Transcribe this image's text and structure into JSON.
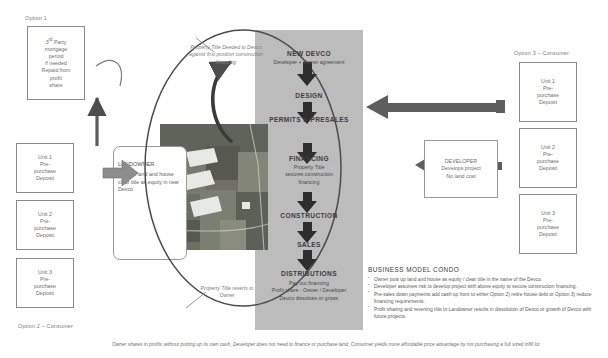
{
  "left_column": {
    "option_label_top": "Option 1",
    "option_label_bottom": "Option 2 – Consumer",
    "boxes": [
      {
        "name": "third-party-mortgage",
        "lines": [
          "3ʳᵈ Party",
          "mortgage",
          "period",
          "if needed",
          "Repaid from",
          "profit",
          "share"
        ]
      },
      {
        "name": "unit-1",
        "lines": [
          "Unit 1",
          "Pre-",
          "purchase",
          "Deposit"
        ]
      },
      {
        "name": "unit-2",
        "lines": [
          "Unit 2",
          "Pre-",
          "purchase",
          "Deposit"
        ]
      },
      {
        "name": "unit-3",
        "lines": [
          "Unit 3",
          "Pre-",
          "purchase",
          "Deposit"
        ]
      }
    ]
  },
  "landowner": {
    "title": "LANDOWNER",
    "body": "Puts up land and house clear title as equity in new Devco"
  },
  "captions": {
    "title_deeded": "Property Title Deeded to Devco against first position construction financing",
    "title_reverts": "Property Title reverts to Owner"
  },
  "center_flow": {
    "steps": [
      {
        "name": "new-devco",
        "title": "NEW DEVCO",
        "sub": "Developer + Owner agreement"
      },
      {
        "name": "design",
        "title": "DESIGN",
        "sub": ""
      },
      {
        "name": "permits-presales",
        "title": "PERMITS & PRESALES",
        "sub": ""
      },
      {
        "name": "financing",
        "title": "FINANCING",
        "sub": "Property Title secures construction financing"
      },
      {
        "name": "construction",
        "title": "CONSTRUCTION",
        "sub": ""
      },
      {
        "name": "sales",
        "title": "SALES",
        "sub": ""
      },
      {
        "name": "distributions",
        "title": "DISTRIBUTIONS",
        "sub": "Pay out financing\nProfit share - Owner / Developer\nDevco dissolves or grows"
      }
    ]
  },
  "developer": {
    "title": "DEVELOPER",
    "line1": "Develops project",
    "line2": "No land cost"
  },
  "right_column": {
    "option_label": "Option 3 – Consumer",
    "boxes": [
      {
        "name": "unit-1",
        "lines": [
          "Unit 1",
          "Pre-",
          "purchase",
          "Deposit"
        ]
      },
      {
        "name": "unit-2",
        "lines": [
          "Unit 2",
          "Pre-",
          "purchase",
          "Deposit"
        ]
      },
      {
        "name": "unit-3",
        "lines": [
          "Unit 3",
          "Pre-",
          "purchase",
          "Deposit"
        ]
      }
    ]
  },
  "business_model": {
    "heading": "BUSINESS MODEL  CONDO",
    "bullets": [
      "Owner puts up land and house as equity / clear title in the name of the Devco.",
      "Developer assumes risk to develop project with above equity to secure construction financing.",
      "Pre-sales down payments add cash up front to either Option 2) retire house debt or Option 3) reduce financing requirements.",
      "Profit sharing and reverting title to Landowner results in dissolution of Devco or growth of Devco with future projects."
    ]
  },
  "footer_note": "Owner shares in profits without putting up its own cash_Developer does not need to finance or purchase land_Consumer yields more affordable price advantage by not purchasing a full sized infill lot",
  "colors": {
    "band": "#b9b9b9",
    "arrow": "#6a6a6a",
    "box_border": "#8a8a8a",
    "text": "#5f5f5f"
  }
}
